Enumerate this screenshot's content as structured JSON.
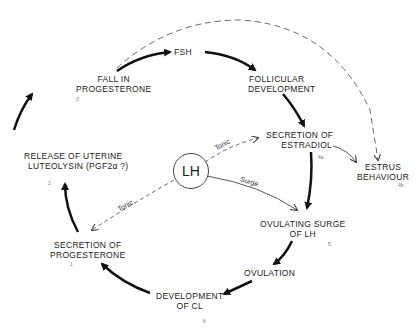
{
  "diagram": {
    "center": {
      "label": "LH"
    },
    "nodes": [
      {
        "id": "fsh",
        "label_lines": [
          "FSH"
        ],
        "number": ""
      },
      {
        "id": "follicular",
        "label_lines": [
          "FOLLICULAR",
          "DEVELOPMENT"
        ],
        "number": ""
      },
      {
        "id": "estradiol",
        "label_lines": [
          "SECRETION  OF",
          "ESTRADIOL"
        ],
        "number": "4a"
      },
      {
        "id": "estrus",
        "label_lines": [
          "ESTRUS",
          "BEHAVIOUR"
        ],
        "number": "4b"
      },
      {
        "id": "surge",
        "label_lines": [
          "OVULATING  SURGE",
          "OF   LH"
        ],
        "number": "5"
      },
      {
        "id": "ovulation",
        "label_lines": [
          "OVULATION"
        ],
        "number": ""
      },
      {
        "id": "cl",
        "label_lines": [
          "DEVELOPMENT",
          "OF   CL"
        ],
        "number": "6"
      },
      {
        "id": "progesterone_secretion",
        "label_lines": [
          "SECRETION  OF",
          "PROGESTERONE"
        ],
        "number": "1"
      },
      {
        "id": "luteolysin",
        "label_lines": [
          "RELEASE OF UTERINE",
          "LUTEOLYSIN (PGF2α ?)"
        ],
        "number": "2"
      },
      {
        "id": "fall_progesterone",
        "label_lines": [
          "FALL IN",
          "PROGESTERONE"
        ],
        "number": "3"
      }
    ],
    "edge_labels": {
      "tonic_to_estradiol": "Tonic",
      "tonic_to_progesterone": "Tonic",
      "surge": "Surge"
    },
    "colors": {
      "line": "#111111",
      "dashed": "#555555",
      "background": "#ffffff"
    }
  }
}
